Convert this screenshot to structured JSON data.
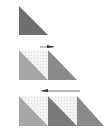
{
  "diagram": {
    "colors": {
      "dark_triangle": "#6e6e6e",
      "mid_triangle": "#8a8a8a",
      "light_triangle": "#a6a6a6",
      "speckled_fill": "#efefef",
      "arrow": "#555555"
    },
    "rows": [
      {
        "label": "row-1",
        "tiles": 1,
        "arrow": null
      },
      {
        "label": "row-2",
        "tiles": 2,
        "arrow": "right"
      },
      {
        "label": "row-3",
        "tiles": 3,
        "arrow": "left"
      }
    ]
  }
}
